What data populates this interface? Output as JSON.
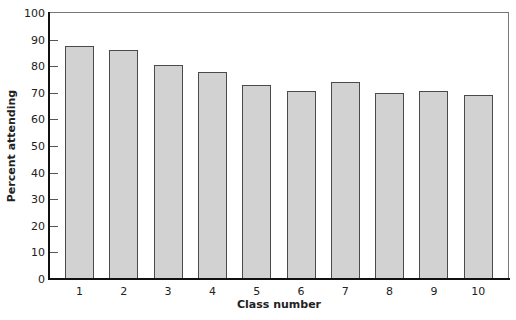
{
  "chart_data": {
    "type": "bar",
    "title": "",
    "xlabel": "Class number",
    "ylabel": "Percent attending",
    "categories": [
      "1",
      "2",
      "3",
      "4",
      "5",
      "6",
      "7",
      "8",
      "9",
      "10"
    ],
    "values": [
      87.5,
      86,
      80.5,
      78,
      73,
      70.5,
      74,
      70,
      70.5,
      69
    ],
    "ylim": [
      0,
      100
    ],
    "yticks": [
      "0",
      "10",
      "20",
      "30",
      "40",
      "50",
      "60",
      "70",
      "80",
      "90",
      "100"
    ],
    "grid": false,
    "legend": null,
    "colors": {
      "bar_fill": "#d2d2d2",
      "bar_edge": "#4a4a4a",
      "axis": "#111111"
    }
  }
}
